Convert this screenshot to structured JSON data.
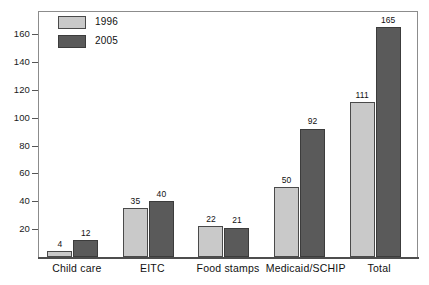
{
  "chart_data": {
    "type": "bar",
    "title": "",
    "subtitle": "",
    "xlabel": "",
    "ylabel": "",
    "categories": [
      "Child care",
      "EITC",
      "Food stamps",
      "Medicaid/SCHIP",
      "Total"
    ],
    "series": [
      {
        "name": "1996",
        "color": "#c9c9c9",
        "values": [
          4,
          35,
          22,
          50,
          111
        ]
      },
      {
        "name": "2005",
        "color": "#5a5a5a",
        "values": [
          12,
          40,
          21,
          92,
          165
        ]
      }
    ],
    "ylim": [
      0,
      176
    ],
    "yticks": [
      20,
      40,
      60,
      80,
      100,
      120,
      140,
      160
    ],
    "ytick_labels": [
      "20",
      "40",
      "60",
      "80",
      "100",
      "120",
      "140",
      "160"
    ],
    "grid": false,
    "legend_position": "top-left-inside",
    "data_labels": true,
    "frame": true
  },
  "legend": {
    "entries": [
      {
        "label": "1996",
        "swatch": "legend-swatch-1996"
      },
      {
        "label": "2005",
        "swatch": "legend-swatch-2005"
      }
    ]
  }
}
